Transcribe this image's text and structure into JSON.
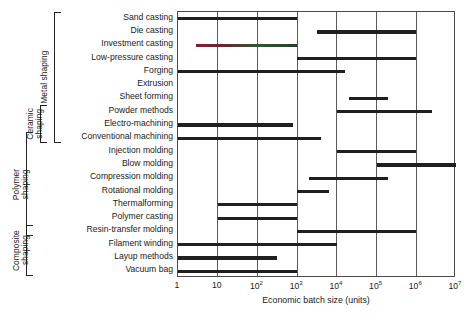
{
  "chart_data": {
    "type": "bar",
    "title": "",
    "xlabel": "Economic batch size (units)",
    "ylabel": "",
    "scale": "log10",
    "xlim": [
      0,
      7
    ],
    "grid": true,
    "legend": null,
    "xticks": [
      {
        "label": "1",
        "exp": null,
        "value": 0
      },
      {
        "label": "10",
        "exp": null,
        "value": 1
      },
      {
        "label": "10",
        "exp": "2",
        "value": 2
      },
      {
        "label": "10",
        "exp": "3",
        "value": 3
      },
      {
        "label": "10",
        "exp": "4",
        "value": 4
      },
      {
        "label": "10",
        "exp": "5",
        "value": 5
      },
      {
        "label": "10",
        "exp": "6",
        "value": 6
      },
      {
        "label": "10",
        "exp": "7",
        "value": 7
      }
    ],
    "categories": [
      "Sand casting",
      "Die casting",
      "Investment casting",
      "Low-pressure casting",
      "Forging",
      "Extrusion",
      "Sheet forming",
      "Powder methods",
      "Electro-machining",
      "Conventional machining",
      "Injection molding",
      "Blow molding",
      "Compression molding",
      "Rotational molding",
      "Thermalforming",
      "Polymer casting",
      "Resin-transfer molding",
      "Filament winding",
      "Layup methods",
      "Vacuum bag"
    ],
    "ranges": [
      {
        "name": "Sand casting",
        "start_exp": 0.0,
        "end_exp": 3.0,
        "tinted": false
      },
      {
        "name": "Die casting",
        "start_exp": 3.5,
        "end_exp": 6.0,
        "tinted": false
      },
      {
        "name": "Investment casting",
        "start_exp": 0.45,
        "end_exp": 3.0,
        "tinted": true
      },
      {
        "name": "Low-pressure casting",
        "start_exp": 3.0,
        "end_exp": 6.0,
        "tinted": false
      },
      {
        "name": "Forging",
        "start_exp": 0.0,
        "end_exp": 4.2,
        "tinted": false
      },
      {
        "name": "Extrusion",
        "start_exp": null,
        "end_exp": null,
        "tinted": false
      },
      {
        "name": "Sheet forming",
        "start_exp": 4.3,
        "end_exp": 5.3,
        "tinted": false
      },
      {
        "name": "Powder methods",
        "start_exp": 4.0,
        "end_exp": 6.4,
        "tinted": false
      },
      {
        "name": "Electro-machining",
        "start_exp": 0.0,
        "end_exp": 2.9,
        "tinted": false
      },
      {
        "name": "Conventional machining",
        "start_exp": 0.0,
        "end_exp": 3.6,
        "tinted": false
      },
      {
        "name": "Injection molding",
        "start_exp": 4.0,
        "end_exp": 6.0,
        "tinted": false
      },
      {
        "name": "Blow molding",
        "start_exp": 5.0,
        "end_exp": 7.0,
        "tinted": false
      },
      {
        "name": "Compression molding",
        "start_exp": 3.3,
        "end_exp": 5.3,
        "tinted": false
      },
      {
        "name": "Rotational molding",
        "start_exp": 3.0,
        "end_exp": 3.8,
        "tinted": false
      },
      {
        "name": "Thermalforming",
        "start_exp": 1.0,
        "end_exp": 3.0,
        "tinted": false
      },
      {
        "name": "Polymer casting",
        "start_exp": 1.0,
        "end_exp": 3.0,
        "tinted": false
      },
      {
        "name": "Resin-transfer molding",
        "start_exp": 3.0,
        "end_exp": 6.0,
        "tinted": false
      },
      {
        "name": "Filament winding",
        "start_exp": 0.0,
        "end_exp": 4.0,
        "tinted": false
      },
      {
        "name": "Layup methods",
        "start_exp": 0.0,
        "end_exp": 2.5,
        "tinted": false
      },
      {
        "name": "Vacuum bag",
        "start_exp": 0.0,
        "end_exp": 3.0,
        "tinted": false
      }
    ],
    "groups": [
      {
        "label": "Metal shaping",
        "first_row": 0,
        "last_row": 9
      },
      {
        "label": "Ceramic\nshaping",
        "first_row": 7,
        "last_row": 9
      },
      {
        "label": "Polymer\nshaping",
        "first_row": 9,
        "last_row": 16
      },
      {
        "label": "Composite\nshaping",
        "first_row": 16,
        "last_row": 19
      }
    ],
    "colors": {
      "bar": "#202020",
      "grid": "#5a5a5a",
      "frame": "#4a4a4a",
      "text": "#1a1a1a",
      "tint_a": "#7a2430",
      "tint_b": "#2c5a2c"
    }
  }
}
